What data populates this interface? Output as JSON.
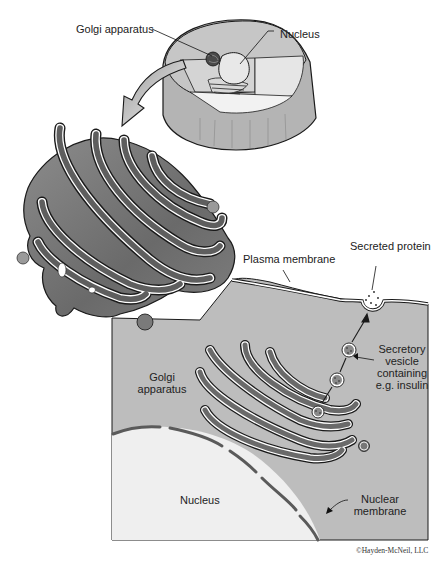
{
  "figure": {
    "labels": {
      "golgi_top": "Golgi apparatus",
      "nucleus_top": "Nucleus",
      "plasma_membrane": "Plasma membrane",
      "secreted_protein": "Secreted protein",
      "secretory_vesicle": [
        "Secretory",
        "vesicle",
        "containing",
        "e.g. insulin"
      ],
      "golgi_inner": [
        "Golgi",
        "apparatus"
      ],
      "nucleus_inner": "Nucleus",
      "nuclear_membrane": [
        "Nuclear",
        "membrane"
      ]
    },
    "credit": "©Hayden-McNeil, LLC"
  },
  "colors": {
    "cytoplasm": "#bdbdbd",
    "nucleus": "#efefef",
    "golgi_dark": "#5a5a5a",
    "golgi_mid": "#8a8a8a",
    "membrane_dark": "#555555",
    "outline": "#1a1a1a"
  }
}
